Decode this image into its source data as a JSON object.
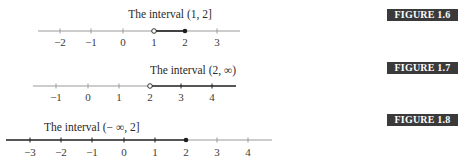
{
  "figures": [
    {
      "id": "1.6",
      "badge": "FIGURE 1.6",
      "caption": "The interval (1, 2]",
      "ticks": [
        "-2",
        "-1",
        "0",
        "1",
        "2",
        "3"
      ],
      "tick_labels": [
        "−2",
        "−1",
        "0",
        "1",
        "2",
        "3"
      ],
      "interval": {
        "start": "1",
        "end": "2",
        "start_closed": false,
        "end_closed": true
      }
    },
    {
      "id": "1.7",
      "badge": "FIGURE 1.7",
      "caption": "The interval (2, ∞)",
      "ticks": [
        "-1",
        "0",
        "1",
        "2",
        "3",
        "4"
      ],
      "tick_labels": [
        "−1",
        "0",
        "1",
        "2",
        "3",
        "4"
      ],
      "interval": {
        "start": "2",
        "end": "∞",
        "start_closed": false,
        "end_closed": false
      }
    },
    {
      "id": "1.8",
      "badge": "FIGURE 1.8",
      "caption": "The interval (− ∞, 2]",
      "ticks": [
        "-3",
        "-2",
        "-1",
        "0",
        "1",
        "2",
        "3",
        "4"
      ],
      "tick_labels": [
        "−3",
        "−2",
        "−1",
        "0",
        "1",
        "2",
        "3",
        "4"
      ],
      "interval": {
        "start": "−∞",
        "end": "2",
        "start_closed": false,
        "end_closed": true
      }
    }
  ],
  "colors": {
    "axis": "#9a9a9a",
    "interval": "#1e1e1e",
    "badge_bg": "#3a3a3a",
    "badge_text": "#ffffff"
  }
}
